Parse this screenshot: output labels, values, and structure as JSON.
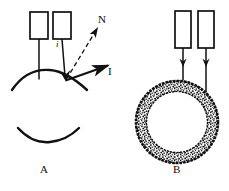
{
  "figure": {
    "type": "scientific-diagram",
    "stroke_color": "#111111",
    "background_color": "#ffffff",
    "panels": [
      {
        "id": "A",
        "caption": "A",
        "caption_position": {
          "x": 42,
          "y": 170
        },
        "description": "Two probes above a convex curved surface with incident angle i, surface normal N and reflected beam I; a separate concave arc below",
        "elements": {
          "rect_left": {
            "name": "probe-left",
            "x": 30,
            "y": 12,
            "w": 18,
            "h": 27
          },
          "rect_right": {
            "name": "probe-right",
            "x": 53,
            "y": 12,
            "w": 18,
            "h": 27
          },
          "stem_left": {
            "x1": 39,
            "y1": 39,
            "x2": 39,
            "y2": 80
          },
          "stem_right": {
            "x1": 62,
            "y1": 39,
            "x2": 65,
            "y2": 79
          },
          "convex_arc": {
            "left_x": 12,
            "right_x": 86,
            "apex_y": 71,
            "edge_y": 90
          },
          "concave_arc": {
            "left_x": 18,
            "right_x": 78,
            "edge_y": 128,
            "bottom_y": 141
          },
          "normal_arrow": {
            "x1": 66,
            "y1": 79,
            "x2": 99,
            "y2": 26,
            "style": "dashed"
          },
          "beam_arrow": {
            "x1": 65,
            "y1": 80,
            "x2": 110,
            "y2": 65,
            "style": "solid"
          }
        },
        "labels": [
          {
            "name": "incidence-angle-label",
            "text": "i",
            "x": 57,
            "y": 41,
            "size": 9,
            "style": "italic"
          },
          {
            "name": "normal-label",
            "text": "N",
            "x": 99,
            "y": 15,
            "size": 10,
            "style": "normal"
          },
          {
            "name": "beam-label",
            "text": "I",
            "x": 108,
            "y": 67,
            "size": 10,
            "style": "normal"
          }
        ]
      },
      {
        "id": "B",
        "caption": "B",
        "caption_position": {
          "x": 174,
          "y": 168
        },
        "description": "Two probes with downward arrows directed onto a stippled annular ring (textured torus cross-section)",
        "elements": {
          "rect_left": {
            "name": "probe-left",
            "x": 175,
            "y": 11,
            "w": 16,
            "h": 37
          },
          "rect_right": {
            "name": "probe-right",
            "x": 198,
            "y": 11,
            "w": 16,
            "h": 37
          },
          "arrow_left": {
            "x1": 183,
            "y1": 48,
            "x2": 183,
            "y2": 88,
            "head_y": 63
          },
          "arrow_right": {
            "x1": 206,
            "y1": 48,
            "x2": 206,
            "y2": 92,
            "head_y": 63
          },
          "annulus": {
            "cx": 177,
            "cy": 122,
            "outer_r": 42,
            "inner_r": 30,
            "fill": "stippled"
          }
        },
        "labels": []
      }
    ]
  }
}
